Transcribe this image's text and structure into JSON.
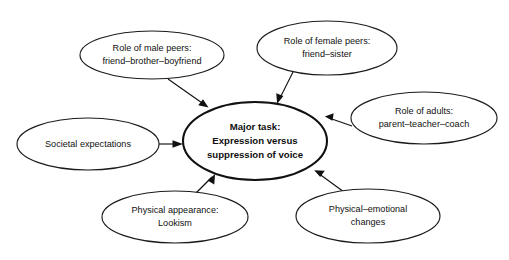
{
  "diagram": {
    "title_text": "Major task: Expression versus suppression of voice",
    "background_color": "#ffffff",
    "stroke_color": "#111111",
    "central_node": {
      "name": "major-task",
      "lines": [
        "Major task:",
        "Expression versus",
        "suppression of voice"
      ],
      "line1": "Major task:",
      "line2": "Expression versus",
      "line3": "suppression of voice",
      "bold": true
    },
    "nodes": [
      {
        "name": "role-of-male-peers",
        "line1": "Role of male peers:",
        "line2": "friend–brother–boyfriend"
      },
      {
        "name": "role-of-female-peers",
        "line1": "Role of female peers:",
        "line2": "friend–sister"
      },
      {
        "name": "role-of-adults",
        "line1": "Role of adults:",
        "line2": "parent–teacher–coach"
      },
      {
        "name": "societal-expectations",
        "line1": "Societal expectations",
        "line2": ""
      },
      {
        "name": "physical-appearance",
        "line1": "Physical appearance:",
        "line2": "Lookism"
      },
      {
        "name": "physical-emotional-changes",
        "line1": "Physical–emotional",
        "line2": "changes"
      }
    ],
    "edges": [
      {
        "name": "edge-male-peers-to-major-task",
        "from": "role-of-male-peers",
        "to": "major-task"
      },
      {
        "name": "edge-female-peers-to-major-task",
        "from": "role-of-female-peers",
        "to": "major-task"
      },
      {
        "name": "edge-adults-to-major-task",
        "from": "role-of-adults",
        "to": "major-task"
      },
      {
        "name": "edge-societal-to-major-task",
        "from": "societal-expectations",
        "to": "major-task"
      },
      {
        "name": "edge-appearance-to-major-task",
        "from": "physical-appearance",
        "to": "major-task"
      },
      {
        "name": "edge-changes-to-major-task",
        "from": "physical-emotional-changes",
        "to": "major-task"
      }
    ]
  }
}
